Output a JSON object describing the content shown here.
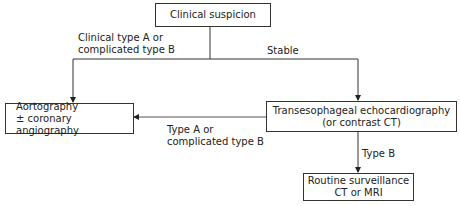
{
  "diagram": {
    "type": "flowchart",
    "nodes": {
      "clinical_suspicion": {
        "lines": [
          "Clinical suspicion"
        ]
      },
      "aortography": {
        "lines": [
          "Aortography",
          "± coronary angiography"
        ]
      },
      "tee": {
        "lines": [
          "Transesophageal echocardiography",
          "(or contrast CT)"
        ]
      },
      "routine": {
        "lines": [
          "Routine surveillance",
          "CT or MRI"
        ]
      }
    },
    "edges": {
      "suspicion_to_aorto": {
        "lines": [
          "Clinical type A or",
          "complicated type B"
        ]
      },
      "suspicion_to_tee": {
        "lines": [
          "Stable"
        ]
      },
      "tee_to_aorto": {
        "lines": [
          "Type A or",
          "complicated type B"
        ]
      },
      "tee_to_routine": {
        "lines": [
          "Type B"
        ]
      }
    },
    "colors": {
      "line": "#333333",
      "box_border": "#333333",
      "text": "#222222",
      "background": "#ffffff"
    }
  }
}
